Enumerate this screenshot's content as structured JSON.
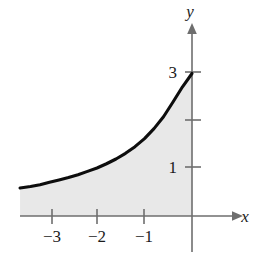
{
  "figure": {
    "background_color": "#ffffff",
    "width": 265,
    "height": 259
  },
  "axes": {
    "x_axis_label": "x",
    "y_axis_label": "y",
    "axis_color": "#6e6e6e",
    "x_tick_labels": [
      "−3",
      "−2",
      "−1"
    ],
    "y_tick_labels": [
      "1",
      "3"
    ],
    "x_tick_values": [
      -3,
      -2,
      -1
    ],
    "y_tick_values": [
      1,
      2,
      3
    ],
    "y_tick_values_labeled": [
      1,
      3
    ]
  },
  "region": {
    "fill_color": "#e8e8e8",
    "curve_color": "#0d0d0d"
  },
  "chart_data": {
    "type": "area",
    "title": "",
    "xlabel": "x",
    "ylabel": "y",
    "xlim": [
      -3.62,
      0.95
    ],
    "ylim": [
      -0.72,
      3.96
    ],
    "grid": false,
    "legend": null,
    "xticks": [
      -3,
      -2,
      -1
    ],
    "xticklabels": [
      "−3",
      "−2",
      "−1"
    ],
    "yticks": [
      1,
      2,
      3
    ],
    "yticklabels": [
      "1",
      "",
      "3"
    ],
    "series": [
      {
        "name": "y = 3e^x shaded region",
        "description": "Increasing exponential curve passing through (0, 3); region between curve and x-axis is shaded light gray for x from -3.62 to 0.",
        "x": [
          -3.62,
          -3.4,
          -3.2,
          -3.0,
          -2.8,
          -2.6,
          -2.4,
          -2.2,
          -2.0,
          -1.8,
          -1.6,
          -1.4,
          -1.2,
          -1.0,
          -0.8,
          -0.6,
          -0.4,
          -0.2,
          0.0
        ],
        "y": [
          0.59,
          0.62,
          0.66,
          0.71,
          0.76,
          0.81,
          0.87,
          0.94,
          1.01,
          1.1,
          1.2,
          1.32,
          1.46,
          1.63,
          1.84,
          2.09,
          2.4,
          2.72,
          3.0
        ]
      }
    ],
    "annotations": [
      {
        "text": "3",
        "x": 0,
        "y": 3,
        "role": "y-tick-label"
      },
      {
        "text": "1",
        "x": 0,
        "y": 1,
        "role": "y-tick-label"
      }
    ]
  }
}
